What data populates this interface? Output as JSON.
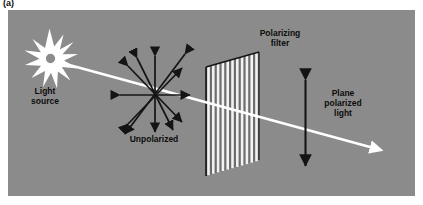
{
  "figure": {
    "caption_label": "(a)",
    "background_color": "#8b8b8b",
    "page_color": "#ffffff",
    "beam_color": "#ffffff",
    "arrow_color": "#141414",
    "text_color": "#0d0d0d"
  },
  "labels": {
    "light_source": "Light\nsource",
    "unpolarized": "Unpolarized",
    "polarizing_filter": "Polarizing\nfilter",
    "plane_polarized_light": "Plane\npolarized\nlight"
  },
  "elements": {
    "light_source_star": "starburst-icon",
    "unpolarized_arrows": "multi-direction-double-arrow-icon",
    "polarizing_filter_panel": "slatted-filter-icon",
    "light_beam": "beam-arrow-icon",
    "plane_polarized_arrow": "vertical-double-arrow-icon"
  },
  "diagram_data": {
    "type": "physics-schematic",
    "subject": "Polarization of light by a polarizing filter",
    "stages": [
      {
        "name": "light-source",
        "label": "Light source",
        "position": {
          "x": 50,
          "y": 62
        },
        "description": "Point source emitting unpolarized light"
      },
      {
        "name": "unpolarized-light",
        "label": "Unpolarized",
        "position": {
          "x": 155,
          "y": 95
        },
        "oscillation_directions": 8,
        "description": "Electric field vectors oriented in all directions perpendicular to propagation"
      },
      {
        "name": "polarizing-filter",
        "label": "Polarizing filter",
        "position": {
          "x": 240,
          "y": 110
        },
        "slit_count": 12,
        "slit_orientation": "vertical",
        "description": "Transmits only the component of the field parallel to the transmission axis"
      },
      {
        "name": "plane-polarized-light",
        "label": "Plane polarized light",
        "position": {
          "x": 305,
          "y": 122
        },
        "oscillation_directions": 1,
        "oscillation_axis": "vertical",
        "description": "Light oscillating in a single plane after the filter"
      }
    ],
    "beam": {
      "start": {
        "x": 62,
        "y": 64
      },
      "end": {
        "x": 385,
        "y": 152
      },
      "direction": "left-to-right-descending",
      "arrowhead": "end"
    }
  }
}
